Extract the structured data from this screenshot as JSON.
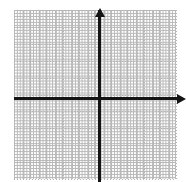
{
  "figure": {
    "background_color": "#ffffff",
    "width_px": 186,
    "height_px": 182
  },
  "grid": {
    "style": "dotted",
    "color": "#b5b5b5",
    "cell_size_px": 16.2,
    "columns": 10,
    "rows": 10,
    "left_px": 14,
    "top_px": 10,
    "width_px": 162,
    "height_px": 169
  },
  "axes": {
    "color": "#141414",
    "thickness_px": 3,
    "origin": {
      "x_px": 99,
      "y_px": 98
    },
    "x_axis": {
      "name": "x-axis",
      "start_px": 14,
      "end_px": 179,
      "arrow_end": "right",
      "label": ""
    },
    "y_axis": {
      "name": "y-axis",
      "start_px": 182,
      "end_px": 10,
      "arrow_end": "up",
      "label": ""
    }
  },
  "chart_data": {
    "type": "scatter",
    "title": "",
    "subtitle": "",
    "xlabel": "",
    "ylabel": "",
    "xlim": [
      -5,
      5
    ],
    "ylim": [
      -5,
      5
    ],
    "xticks": [
      -5,
      -4,
      -3,
      -2,
      -1,
      0,
      1,
      2,
      3,
      4,
      5
    ],
    "yticks": [
      -5,
      -4,
      -3,
      -2,
      -1,
      0,
      1,
      2,
      3,
      4,
      5
    ],
    "xtick_labels": [
      "",
      "",
      "",
      "",
      "",
      "",
      "",
      "",
      "",
      "",
      ""
    ],
    "ytick_labels": [
      "",
      "",
      "",
      "",
      "",
      "",
      "",
      "",
      "",
      "",
      ""
    ],
    "grid": true,
    "grid_style": "dotted",
    "legend": false,
    "legend_position": "none",
    "series": [],
    "annotations": []
  }
}
